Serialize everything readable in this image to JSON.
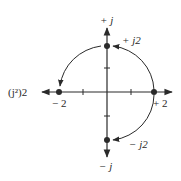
{
  "diagram": {
    "type": "complex-plane-rotation",
    "labels": {
      "pos_j": "+ j",
      "neg_j": "− j",
      "pos_j2": "+ j2",
      "neg_j2": "− j2",
      "pos_2": "+ 2",
      "neg_2": "− 2",
      "j_squared_2": "(j²)2"
    },
    "points": [
      {
        "name": "+2",
        "re": 2,
        "im": 0
      },
      {
        "name": "+j2",
        "re": 0,
        "im": 2
      },
      {
        "name": "-2",
        "re": -2,
        "im": 0
      },
      {
        "name": "-j2",
        "re": 0,
        "im": -2
      }
    ],
    "arrows": [
      {
        "from": "+2",
        "to": "+j2"
      },
      {
        "from": "+j2",
        "to": "-2"
      },
      {
        "from": "+2",
        "to": "-j2"
      }
    ],
    "colors": {
      "ink": "#2a2a2a",
      "background": "#ffffff"
    }
  }
}
